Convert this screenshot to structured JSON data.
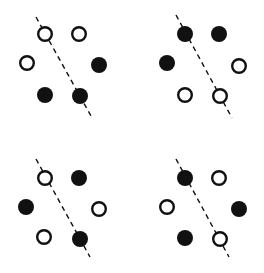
{
  "diagram": {
    "colors": {
      "ink": "#111111",
      "background": "#ffffff"
    },
    "dot_radius": 8,
    "panels": [
      {
        "id": "top-left",
        "line": {
          "x1": 36,
          "y1": 17,
          "x2": 91,
          "y2": 116
        },
        "dots": [
          {
            "x": 45,
            "y": 34,
            "fill": "open"
          },
          {
            "x": 79,
            "y": 34,
            "fill": "open"
          },
          {
            "x": 27,
            "y": 63,
            "fill": "open"
          },
          {
            "x": 99,
            "y": 65,
            "fill": "filled"
          },
          {
            "x": 45,
            "y": 95,
            "fill": "filled"
          },
          {
            "x": 80,
            "y": 96,
            "fill": "filled"
          }
        ]
      },
      {
        "id": "top-right",
        "line": {
          "x1": 176,
          "y1": 15,
          "x2": 232,
          "y2": 118
        },
        "dots": [
          {
            "x": 185,
            "y": 34,
            "fill": "filled"
          },
          {
            "x": 219,
            "y": 34,
            "fill": "filled"
          },
          {
            "x": 167,
            "y": 63,
            "fill": "filled"
          },
          {
            "x": 239,
            "y": 66,
            "fill": "open"
          },
          {
            "x": 185,
            "y": 95,
            "fill": "open"
          },
          {
            "x": 220,
            "y": 96,
            "fill": "open"
          }
        ]
      },
      {
        "id": "bottom-left",
        "line": {
          "x1": 36,
          "y1": 159,
          "x2": 90,
          "y2": 257
        },
        "dots": [
          {
            "x": 45,
            "y": 178,
            "fill": "open"
          },
          {
            "x": 79,
            "y": 178,
            "fill": "filled"
          },
          {
            "x": 26,
            "y": 207,
            "fill": "filled"
          },
          {
            "x": 99,
            "y": 209,
            "fill": "open"
          },
          {
            "x": 44,
            "y": 237,
            "fill": "open"
          },
          {
            "x": 80,
            "y": 239,
            "fill": "filled"
          }
        ]
      },
      {
        "id": "bottom-right",
        "line": {
          "x1": 176,
          "y1": 159,
          "x2": 229,
          "y2": 257
        },
        "dots": [
          {
            "x": 185,
            "y": 178,
            "fill": "filled"
          },
          {
            "x": 219,
            "y": 178,
            "fill": "open"
          },
          {
            "x": 167,
            "y": 207,
            "fill": "open"
          },
          {
            "x": 239,
            "y": 209,
            "fill": "filled"
          },
          {
            "x": 185,
            "y": 238,
            "fill": "filled"
          },
          {
            "x": 220,
            "y": 239,
            "fill": "open"
          }
        ]
      }
    ]
  }
}
